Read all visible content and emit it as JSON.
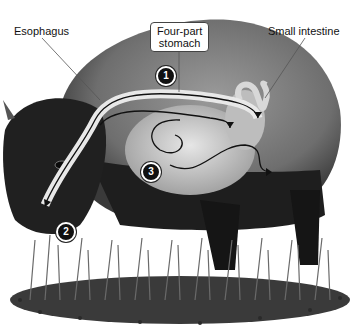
{
  "diagram": {
    "labels": {
      "esophagus": "Esophagus",
      "stomach_line1": "Four-part",
      "stomach_line2": "stomach",
      "small_intestine": "Small intestine"
    },
    "steps": [
      {
        "number": "1"
      },
      {
        "number": "2"
      },
      {
        "number": "3"
      }
    ],
    "colors": {
      "background": "#ffffff",
      "body_light": "#8a8a8a",
      "body_dark": "#1e1e1e",
      "organ": "#c8c8c8",
      "grass": "#5a5a5a",
      "arrow": "#111111"
    }
  }
}
